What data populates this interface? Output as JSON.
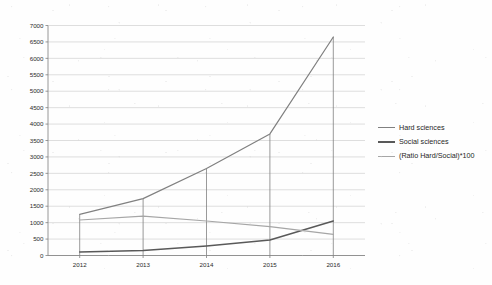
{
  "chart_data": {
    "type": "line",
    "title": "",
    "xlabel": "",
    "ylabel": "",
    "categories": [
      "2012",
      "2013",
      "2014",
      "2015",
      "2016"
    ],
    "ylim": [
      0,
      7000
    ],
    "ytick_step": 500,
    "yticks": [
      "0",
      "500",
      "1000",
      "1500",
      "2000",
      "2500",
      "3000",
      "3500",
      "4000",
      "4500",
      "5000",
      "5500",
      "6000",
      "6500",
      "7000"
    ],
    "grid": true,
    "legend_position": "right",
    "series": [
      {
        "name": "Hard sciences",
        "color": "#808080",
        "values": [
          1250,
          1730,
          2650,
          3700,
          6650
        ]
      },
      {
        "name": "Social sciences",
        "color": "#595959",
        "values": [
          110,
          150,
          290,
          470,
          1050
        ]
      },
      {
        "name": "(Ratio Hard/Social)*100",
        "color": "#a6a6a6",
        "values": [
          1080,
          1200,
          1050,
          880,
          640
        ]
      }
    ],
    "drop_lines": true,
    "axis_color": "#7f7f7f",
    "grid_color": "#d0d0d0"
  },
  "legend": {
    "items": [
      {
        "label": "Hard sciences"
      },
      {
        "label": "Social sciences"
      },
      {
        "label": "(Ratio Hard/Social)*100"
      }
    ]
  }
}
